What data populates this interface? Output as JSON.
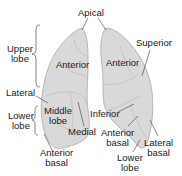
{
  "diagram": {
    "colors": {
      "lung_fill": "#d9d9d9",
      "lung_stroke": "#9a9a9a",
      "leader_line": "#555555",
      "text": "#1a1a1a"
    },
    "labels": {
      "apical": "Apical",
      "upper_lobe_line1": "Upper",
      "upper_lobe_line2": "lobe",
      "anterior_left": "Anterior",
      "anterior_right": "Anterior",
      "superior": "Superior",
      "lateral": "Lateral",
      "lower_lobe_left_line1": "Lower",
      "lower_lobe_left_line2": "lobe",
      "middle_lobe_line1": "Middle",
      "middle_lobe_line2": "lobe",
      "inferior": "Inferior",
      "medial": "Medial",
      "anterior_basal_center_line1": "Anterior",
      "anterior_basal_center_line2": "basal",
      "lateral_basal_line1": "Lateral",
      "lateral_basal_line2": "basal",
      "lower_lobe_right_line1": "Lower",
      "lower_lobe_right_line2": "lobe",
      "anterior_basal_left_line1": "Anterior",
      "anterior_basal_left_line2": "basal"
    }
  }
}
